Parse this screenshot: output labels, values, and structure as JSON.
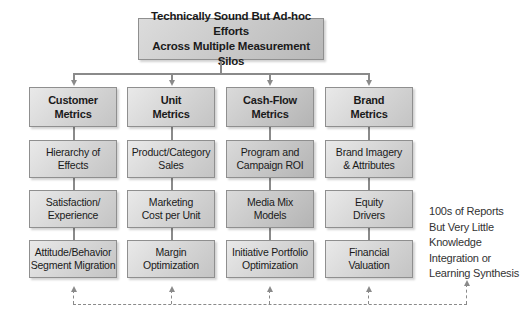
{
  "title": {
    "line1": "Technically Sound But Ad-hoc Efforts",
    "line2": "Across Multiple Measurement Silos"
  },
  "columns": [
    {
      "header": [
        "Customer",
        "Metrics"
      ],
      "items": [
        [
          "Hierarchy of",
          "Effects"
        ],
        [
          "Satisfaction/",
          "Experience"
        ],
        [
          "Attitude/Behavior",
          "Segment Migration"
        ]
      ]
    },
    {
      "header": [
        "Unit",
        "Metrics"
      ],
      "items": [
        [
          "Product/Category",
          "Sales"
        ],
        [
          "Marketing",
          "Cost per Unit"
        ],
        [
          "Margin",
          "Optimization"
        ]
      ]
    },
    {
      "header": [
        "Cash-Flow",
        "Metrics"
      ],
      "items": [
        [
          "Program and",
          "Campaign ROI"
        ],
        [
          "Media Mix",
          "Models"
        ],
        [
          "Initiative Portfolio",
          "Optimization"
        ]
      ]
    },
    {
      "header": [
        "Brand",
        "Metrics"
      ],
      "items": [
        [
          "Brand Imagery",
          "& Attributes"
        ],
        [
          "Equity",
          "Drivers"
        ],
        [
          "Financial",
          "Valuation"
        ]
      ]
    }
  ],
  "note": {
    "lines": [
      "100s of Reports",
      "But Very Little",
      "Knowledge",
      "Integration or",
      "Learning Synthesis"
    ]
  },
  "colors": {
    "box_fill": "#d4d4d4",
    "box_border": "#8f8f8f",
    "connector": "#8a8a8a",
    "text": "#1a1a1a"
  }
}
